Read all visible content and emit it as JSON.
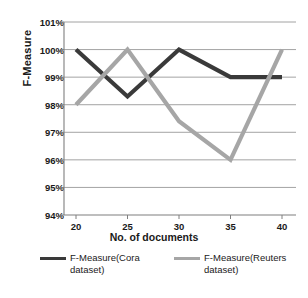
{
  "chart_data": {
    "type": "line",
    "title": "",
    "xlabel": "No. of documents",
    "ylabel": "F-Measure",
    "categories": [
      20,
      25,
      30,
      35,
      40
    ],
    "x_tick_labels": [
      "20",
      "25",
      "30",
      "35",
      "40"
    ],
    "y_tick_labels": [
      "94%",
      "95%",
      "96%",
      "97%",
      "98%",
      "99%",
      "100%",
      "101%"
    ],
    "y_tick_values": [
      94,
      95,
      96,
      97,
      98,
      99,
      100,
      101
    ],
    "ylim": [
      94,
      101
    ],
    "grid": "horizontal",
    "legend_position": "bottom",
    "series": [
      {
        "name": "F-Measure(Cora dataset)",
        "legend_line1": "F-Measure(Cora",
        "legend_line2": "dataset)",
        "color": "#3a3a3a",
        "values": [
          100,
          98.3,
          100,
          99,
          99
        ]
      },
      {
        "name": "F-Measure(Reuters dataset)",
        "legend_line1": "F-Measure(Reuters",
        "legend_line2": "dataset)",
        "color": "#a6a6a6",
        "values": [
          98,
          100,
          97.4,
          96,
          100
        ]
      }
    ]
  },
  "axis": {
    "y_title": "F-Measure",
    "x_title": "No. of documents"
  },
  "colors": {
    "axis": "#7f7f7f",
    "grid": "#8c8c8c",
    "text": "#1a1a1a",
    "background": "#ffffff"
  }
}
